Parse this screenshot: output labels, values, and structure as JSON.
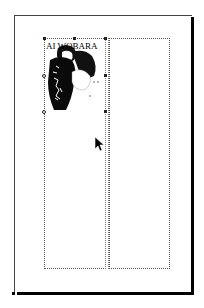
{
  "document": {
    "page": {
      "columns": 2
    },
    "image_caption": "AI WOBARA",
    "image_subject": "woodblock-print-figure"
  },
  "cursor": {
    "type": "arrow-pointer"
  },
  "colors": {
    "ink": "#000000",
    "paper": "#ffffff",
    "guide": "#555555"
  }
}
